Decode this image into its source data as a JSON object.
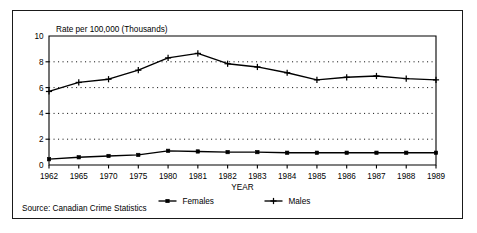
{
  "figure": {
    "source_note": "Source: Canadian Crime Statistics"
  },
  "chart_data": {
    "type": "line",
    "title": "",
    "ylabel": "Rate per 100,000 (Thousands)",
    "xlabel": "YEAR",
    "categories": [
      "1962",
      "1965",
      "1970",
      "1975",
      "1980",
      "1981",
      "1982",
      "1983",
      "1984",
      "1985",
      "1986",
      "1987",
      "1988",
      "1989"
    ],
    "ylim": [
      0,
      10
    ],
    "yticks": [
      0,
      2,
      4,
      6,
      8,
      10
    ],
    "grid": "horizontal-dotted",
    "legend_position": "below-axis",
    "series": [
      {
        "name": "Females",
        "marker": "square",
        "values": [
          0.45,
          0.6,
          0.7,
          0.78,
          1.1,
          1.05,
          1.0,
          1.0,
          0.95,
          0.95,
          0.95,
          0.95,
          0.95,
          0.95
        ]
      },
      {
        "name": "Males",
        "marker": "plus",
        "values": [
          5.7,
          6.4,
          6.65,
          7.35,
          8.3,
          8.65,
          7.85,
          7.6,
          7.15,
          6.6,
          6.8,
          6.9,
          6.7,
          6.6
        ]
      }
    ]
  }
}
